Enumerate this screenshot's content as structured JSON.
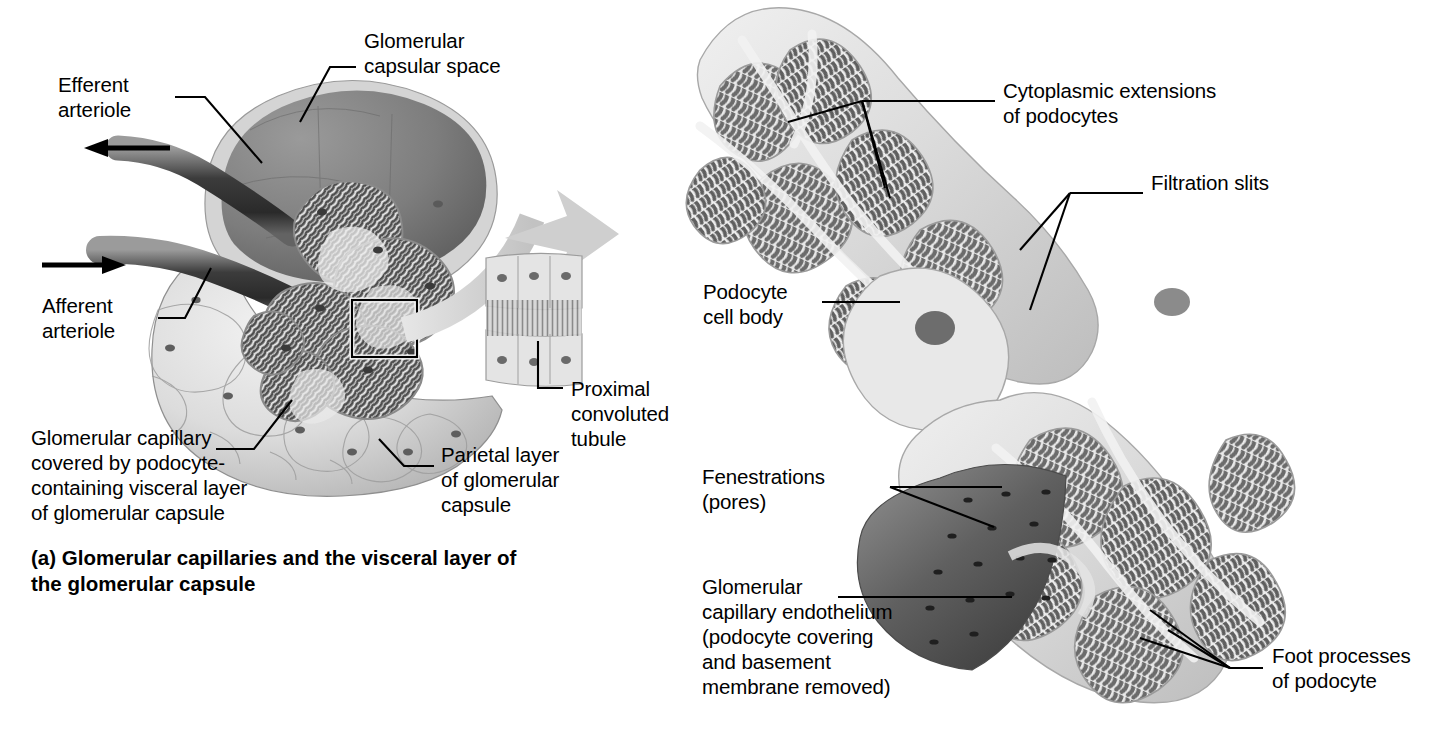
{
  "figure": {
    "title_a": "(a) Glomerular capillaries and the visceral layer of\n     the glomerular capsule"
  },
  "panel_a": {
    "name": "glomerular-capsule-overview",
    "labels": {
      "efferent_arteriole": "Efferent\narteriole",
      "glomerular_capsular_space": "Glomerular\ncapsular space",
      "afferent_arteriole": "Afferent\narteriole",
      "glomerular_capillary": "Glomerular capillary\ncovered by podocyte-\ncontaining visceral layer\nof glomerular capsule",
      "parietal_layer": "Parietal layer\nof glomerular\ncapsule",
      "proximal_convoluted_tubule": "Proximal\nconvoluted\ntubule"
    }
  },
  "panel_b": {
    "name": "podocyte-detail",
    "labels": {
      "cytoplasmic_extensions": "Cytoplasmic extensions\nof podocytes",
      "filtration_slits": "Filtration slits",
      "podocyte_cell_body": "Podocyte\ncell body",
      "fenestrations": "Fenestrations\n(pores)",
      "glomerular_capillary_endothelium": "Glomerular\ncapillary endothelium\n(podocyte covering\nand basement\nmembrane removed)",
      "foot_processes": "Foot processes\nof podocyte"
    }
  },
  "colors": {
    "text": "#000000",
    "leader_line": "#000000",
    "background": "#ffffff",
    "capsule_light": "#d8d8d8",
    "capsular_space_dark": "#7a7a7a",
    "arteriole_dark": "#4a4a4a",
    "flow_arrow": "#cfcfcf",
    "podocyte_body": "#e2e2e2",
    "foot_process_dark": "#6e6e6e",
    "endothelium_dark": "#686868"
  },
  "icons": {
    "inflow_arrow": "arrow-left-icon",
    "outflow_arrow": "arrow-left-icon",
    "filtrate_flow_arrow": "curved-arrow-icon",
    "detail_box": "zoom-region-box"
  }
}
